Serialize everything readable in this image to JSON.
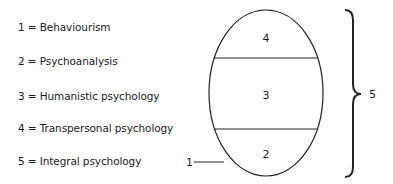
{
  "legend": {
    "items": [
      {
        "key": "1",
        "label": "Behaviourism",
        "text": "1  =  Behaviourism"
      },
      {
        "key": "2",
        "label": "Psychoanalysis",
        "text": "2  =  Psychoanalysis"
      },
      {
        "key": "3",
        "label": "Humanistic psychology",
        "text": "3  =  Humanistic psychology"
      },
      {
        "key": "4",
        "label": "Transpersonal psychology",
        "text": "4  =  Transpersonal psychology"
      },
      {
        "key": "5",
        "label": "Integral psychology",
        "text": "5  =  Integral psychology"
      }
    ]
  },
  "diagram": {
    "regions": {
      "top": "4",
      "middle": "3",
      "bottom": "2"
    },
    "pointer_label": "1",
    "brace_label": "5"
  }
}
